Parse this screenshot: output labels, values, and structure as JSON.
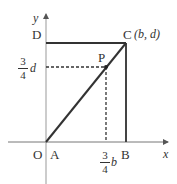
{
  "diagram": {
    "axes": {
      "x_label": "x",
      "y_label": "y"
    },
    "points": {
      "O": {
        "label": "O"
      },
      "A": {
        "label": "A"
      },
      "B": {
        "label": "B"
      },
      "C": {
        "label": "C",
        "coords": "(b,  d)"
      },
      "D": {
        "label": "D"
      },
      "P": {
        "label": "P"
      }
    },
    "x_marker": {
      "numerator": "3",
      "denominator": "4",
      "var": "b"
    },
    "y_marker": {
      "numerator": "3",
      "denominator": "4",
      "var": "d"
    },
    "colors": {
      "line": "#333333",
      "axis": "#777777"
    }
  }
}
